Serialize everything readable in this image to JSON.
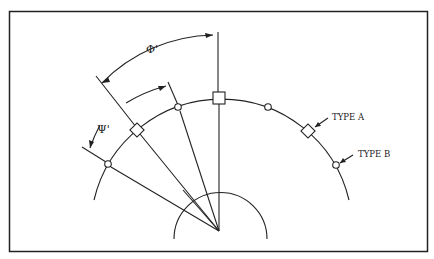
{
  "diagram": {
    "title": "",
    "labels": {
      "phi": "Φ'",
      "psi": "Ψ'",
      "type_a": "TYPE A",
      "type_b": "TYPE B"
    },
    "colors": {
      "stroke": "#222222",
      "background": "#ffffff"
    },
    "legend": [
      {
        "marker": "square-diamond",
        "label": "TYPE A"
      },
      {
        "marker": "circle",
        "label": "TYPE B"
      }
    ]
  }
}
